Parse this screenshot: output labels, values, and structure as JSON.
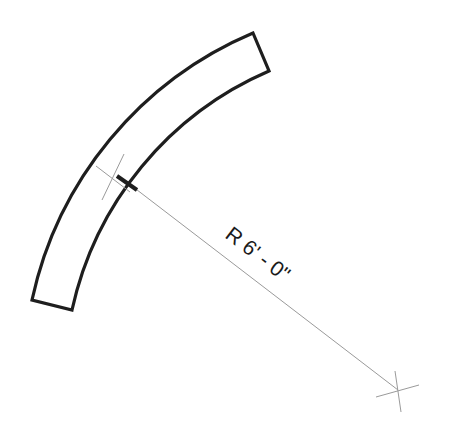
{
  "drawing": {
    "dimension_label": "R 6' - 0\"",
    "colors": {
      "outline": "#1e1e1e",
      "leader": "#9a9a9a",
      "background": "#ffffff"
    },
    "shape": "curved-wall-segment",
    "center_mark": {
      "x": 398,
      "y": 390
    },
    "arc_center_mark": {
      "x": 112,
      "y": 178
    }
  }
}
